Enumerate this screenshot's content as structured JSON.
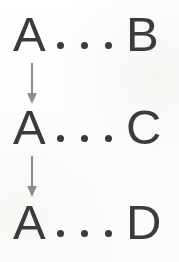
{
  "diagram": {
    "background_color": "#fefefe",
    "glyph_color": "#3b3b3b",
    "arrow_color": "#8d8d8d",
    "ellipsis_text": "...",
    "rows": [
      {
        "id": "row-1",
        "left_symbol": "A",
        "separator": "...",
        "right_symbol": "B",
        "reading": "A ... B"
      },
      {
        "id": "row-2",
        "left_symbol": "A",
        "separator": "...",
        "right_symbol": "C",
        "reading": "A ... C"
      },
      {
        "id": "row-3",
        "left_symbol": "A",
        "separator": "...",
        "right_symbol": "D",
        "reading": "A ... D"
      }
    ],
    "arrows": [
      {
        "id": "arrow-1",
        "direction": "down",
        "from_row": "row-1",
        "to_row": "row-2"
      },
      {
        "id": "arrow-2",
        "direction": "down",
        "from_row": "row-2",
        "to_row": "row-3"
      }
    ]
  }
}
